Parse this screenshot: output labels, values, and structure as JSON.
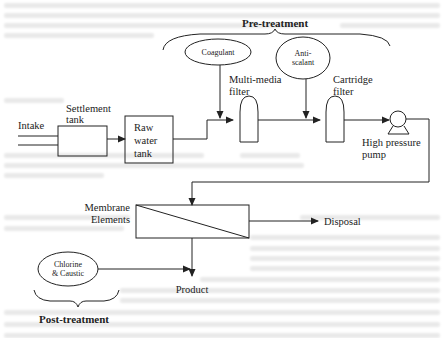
{
  "diagram": {
    "type": "process-flow",
    "groups": {
      "pre_treatment": "Pre-treatment",
      "post_treatment": "Post-treatment"
    },
    "nodes": {
      "intake": "Intake",
      "settlement_tank": [
        "Settlement",
        "tank"
      ],
      "raw_water_tank": [
        "Raw",
        "water",
        "tank"
      ],
      "coagulant": "Coagulant",
      "antiscalant": [
        "Anti-",
        "scalant"
      ],
      "multimedia_filter": [
        "Multi-media",
        "filter"
      ],
      "cartridge_filter": [
        "Cartridge",
        "filter"
      ],
      "high_pressure_pump": [
        "High pressure",
        "pump"
      ],
      "membrane_elements": [
        "Membrane",
        "Elements"
      ],
      "disposal": "Disposal",
      "chlorine_caustic": [
        "Chlorine",
        "& Caustic"
      ],
      "product": "Product"
    },
    "edges": [
      [
        "intake",
        "settlement_tank"
      ],
      [
        "settlement_tank",
        "raw_water_tank"
      ],
      [
        "raw_water_tank",
        "multimedia_filter"
      ],
      [
        "coagulant",
        "multimedia_filter"
      ],
      [
        "multimedia_filter",
        "cartridge_filter"
      ],
      [
        "antiscalant",
        "cartridge_filter"
      ],
      [
        "cartridge_filter",
        "high_pressure_pump"
      ],
      [
        "high_pressure_pump",
        "membrane_elements"
      ],
      [
        "membrane_elements",
        "disposal"
      ],
      [
        "membrane_elements",
        "product"
      ],
      [
        "chlorine_caustic",
        "product"
      ]
    ]
  }
}
